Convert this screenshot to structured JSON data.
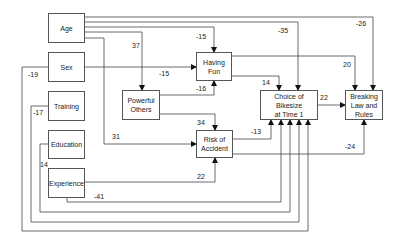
{
  "diagram": {
    "type": "path-diagram",
    "nodes": {
      "age": "Age",
      "sex": "Sex",
      "training": "Training",
      "education": "Education",
      "experience": "Experience",
      "powerful_others": "Powerful Others",
      "having_fun": "Having Fun",
      "risk_of_accident": "Risk of Accident",
      "choice_of_bikesize": "Choice of Bikesize at Time 1",
      "breaking_law": "Breaking Law and Rules"
    },
    "edges": [
      {
        "from": "Age",
        "to": "Powerful Others",
        "coefficient": "37"
      },
      {
        "from": "Age",
        "to": "Having Fun",
        "coefficient": "-15"
      },
      {
        "from": "Age",
        "to": "Choice of Bikesize at Time 1",
        "coefficient": "-35"
      },
      {
        "from": "Age",
        "to": "Breaking Law and Rules",
        "coefficient": "-26"
      },
      {
        "from": "Age",
        "to": "Risk of Accident",
        "coefficient": "31"
      },
      {
        "from": "Sex",
        "to": "Having Fun",
        "coefficient": "-15"
      },
      {
        "from": "Sex",
        "to": "Choice of Bikesize at Time 1",
        "coefficient": "-19"
      },
      {
        "from": "Training",
        "to": "Choice of Bikesize at Time 1",
        "coefficient": "-17"
      },
      {
        "from": "Education",
        "to": "Choice of Bikesize at Time 1",
        "coefficient": "14"
      },
      {
        "from": "Experience",
        "to": "Risk of Accident",
        "coefficient": "22"
      },
      {
        "from": "Experience",
        "to": "Choice of Bikesize at Time 1",
        "coefficient": "-41"
      },
      {
        "from": "Powerful Others",
        "to": "Having Fun",
        "coefficient": "-16"
      },
      {
        "from": "Powerful Others",
        "to": "Risk of Accident",
        "coefficient": "34"
      },
      {
        "from": "Having Fun",
        "to": "Choice of Bikesize at Time 1",
        "coefficient": "14"
      },
      {
        "from": "Having Fun",
        "to": "Breaking Law and Rules",
        "coefficient": "20"
      },
      {
        "from": "Risk of Accident",
        "to": "Choice of Bikesize at Time 1",
        "coefficient": "-13"
      },
      {
        "from": "Risk of Accident",
        "to": "Breaking Law and Rules",
        "coefficient": "-24"
      },
      {
        "from": "Choice of Bikesize at Time 1",
        "to": "Breaking Law and Rules",
        "coefficient": "22"
      }
    ]
  },
  "labels": {
    "age_powerful": "37",
    "age_fun": "-15",
    "age_choice": "-35",
    "age_break": "-26",
    "age_risk": "31",
    "sex_fun": "-15",
    "sex_choice": "-19",
    "training_choice": "-17",
    "education_choice": "14",
    "experience_risk": "22",
    "experience_choice": "-41",
    "powerful_fun": "-16",
    "powerful_risk": "34",
    "fun_choice": "14",
    "fun_break": "20",
    "risk_choice": "-13",
    "risk_break": "-24",
    "choice_break": "22"
  }
}
